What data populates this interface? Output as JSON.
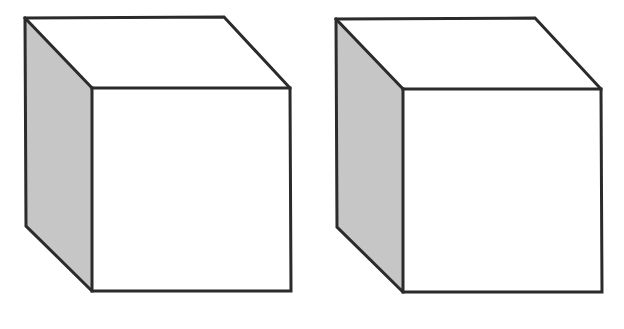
{
  "figure": {
    "caption": "",
    "background_color": "#ffffff",
    "width": 624,
    "height": 329
  },
  "colors": {
    "outline": "#2b2b2b",
    "shaded_face": "#c6c6c6",
    "top_face": "#ffffff",
    "front_face": "#ffffff",
    "dashed_line_dark": "#6e6e6e",
    "dashed_line_light": "#e9e9e9"
  },
  "chart_data": {
    "type": "diagram",
    "objects": [
      {
        "name": "cube-left",
        "label": "",
        "faces": {
          "left": {
            "fill": "#c6c6c6",
            "points": "25,18 92,88 92,291 26,226"
          },
          "top": {
            "fill": "#ffffff",
            "points": "25,18 224,17 290,88 92,88"
          },
          "front": {
            "fill": "#ffffff",
            "points": "92,88 290,88 291,291 92,291"
          }
        },
        "vertices": {
          "back_top_left": [
            25,
            18
          ],
          "back_top_right": [
            224,
            17
          ],
          "front_top_right": [
            290,
            88
          ],
          "front_top_left": [
            92,
            88
          ],
          "front_bottom_left": [
            92,
            291
          ],
          "front_bottom_right": [
            291,
            291
          ],
          "back_bottom_left": [
            26,
            226
          ]
        }
      },
      {
        "name": "cube-right",
        "label": "",
        "faces": {
          "left": {
            "fill": "#c6c6c6",
            "points": "336,19 403,89 403,292 337,227"
          },
          "top": {
            "fill": "#ffffff",
            "points": "336,19 535,18 601,89 403,89"
          },
          "front": {
            "fill": "#ffffff",
            "points": "403,89 601,89 602,292 403,292"
          }
        },
        "vertices": {
          "back_top_left": [
            336,
            19
          ],
          "back_top_right": [
            535,
            18
          ],
          "front_top_right": [
            601,
            89
          ],
          "front_top_left": [
            403,
            89
          ],
          "front_bottom_left": [
            403,
            292
          ],
          "front_bottom_right": [
            602,
            292
          ],
          "back_bottom_left": [
            337,
            227
          ]
        }
      }
    ],
    "dashed_rule": {
      "name": "dashed-baseline",
      "y": 322,
      "x_start": 55,
      "x_end": 556,
      "dash_length": 18,
      "gap_length": 11,
      "thickness": 4,
      "dash_count": 18
    }
  }
}
